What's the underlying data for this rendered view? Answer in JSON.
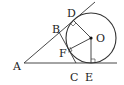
{
  "diagram": {
    "points": {
      "A": {
        "label": "A",
        "x": 24,
        "y": 63
      },
      "B": {
        "label": "B",
        "x": 59,
        "y": 33
      },
      "C": {
        "label": "C",
        "x": 76,
        "y": 63
      },
      "D": {
        "label": "D",
        "x": 73,
        "y": 20
      },
      "E": {
        "label": "E",
        "x": 91,
        "y": 63
      },
      "F": {
        "label": "F",
        "x": 72,
        "y": 50
      },
      "O": {
        "label": "O",
        "x": 91,
        "y": 38
      }
    },
    "circle": {
      "center": "O",
      "radius": 25
    },
    "colors": {
      "stroke": "#333333",
      "fill": "#ffffff"
    }
  }
}
